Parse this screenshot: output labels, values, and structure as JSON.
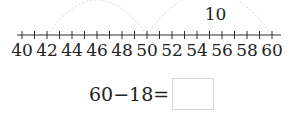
{
  "number_line": {
    "start": 40,
    "end": 60,
    "tick_step": 1,
    "label_step": 2,
    "labels": [
      "40",
      "42",
      "44",
      "46",
      "48",
      "50",
      "52",
      "54",
      "56",
      "58",
      "60"
    ],
    "jumps": [
      {
        "from": 42,
        "to": 50,
        "label": ""
      },
      {
        "from": 50,
        "to": 60,
        "label": "10"
      }
    ]
  },
  "equation": {
    "text": "60−18=",
    "answer": ""
  }
}
